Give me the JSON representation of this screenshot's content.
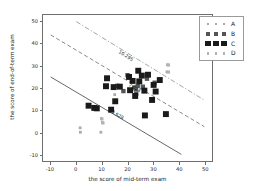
{
  "chart_data": {
    "type": "scatter",
    "title": "",
    "xlabel": "the score of mid-term exam",
    "ylabel": "the score of end-of-term exam",
    "xlim": [
      -13,
      53
    ],
    "ylim": [
      -13,
      53
    ],
    "xticks": [
      -10,
      0,
      10,
      20,
      30,
      40,
      50
    ],
    "yticks": [
      -10,
      0,
      10,
      20,
      30,
      40,
      50
    ],
    "xticklabels": [
      "-10",
      "0",
      "10",
      "20",
      "30",
      "40",
      "50"
    ],
    "yticklabels": [
      "-10",
      "0",
      "10",
      "20",
      "30",
      "40",
      "50"
    ],
    "grid": false,
    "legend_position": "upper right",
    "series": [
      {
        "name": "A",
        "marker": "square",
        "marker_size": 1.4,
        "color": "#aaaaaa",
        "points": [
          [
            1.5,
            2.0
          ],
          [
            1.6,
            0.0
          ],
          [
            9.8,
            6.2
          ],
          [
            10.2,
            4.4
          ],
          [
            9.6,
            0.0
          ],
          [
            35.6,
            30.5
          ],
          [
            35.4,
            27.3
          ],
          [
            15.0,
            17.0
          ]
        ]
      },
      {
        "name": "B",
        "marker": "square",
        "marker_size": 2.2,
        "color": "#555555",
        "points": [
          [
            20.0,
            25.8
          ],
          [
            22.6,
            20.2
          ],
          [
            23.2,
            19.4
          ],
          [
            24.0,
            21.0
          ],
          [
            23.4,
            17.4
          ],
          [
            26.0,
            20.6
          ],
          [
            18.4,
            18.6
          ],
          [
            16.0,
            21.0
          ],
          [
            27.6,
            24.2
          ],
          [
            30.6,
            22.4
          ]
        ]
      },
      {
        "name": "C",
        "marker": "square",
        "marker_size": 3.0,
        "color": "#1a1a1a",
        "points": [
          [
            12.0,
            24.4
          ],
          [
            11.6,
            20.8
          ],
          [
            14.6,
            20.4
          ],
          [
            17.0,
            20.6
          ],
          [
            15.2,
            14.0
          ],
          [
            13.6,
            10.2
          ],
          [
            4.8,
            12.0
          ],
          [
            7.0,
            11.0
          ],
          [
            8.0,
            10.8
          ],
          [
            22.0,
            23.2
          ],
          [
            21.0,
            19.0
          ],
          [
            23.0,
            16.4
          ],
          [
            24.2,
            27.8
          ],
          [
            25.6,
            25.6
          ],
          [
            26.6,
            18.8
          ],
          [
            28.0,
            26.0
          ],
          [
            29.6,
            14.6
          ],
          [
            26.8,
            7.6
          ],
          [
            30.2,
            21.4
          ],
          [
            32.6,
            23.6
          ],
          [
            31.0,
            18.4
          ],
          [
            35.0,
            8.2
          ],
          [
            24.6,
            23.0
          ],
          [
            20.6,
            25.0
          ]
        ]
      },
      {
        "name": "D",
        "marker": "square",
        "marker_size": 1.6,
        "color": "#b4b4b4",
        "points": [
          [
            36.0,
            30.4
          ],
          [
            36.0,
            27.2
          ],
          [
            10.0,
            6.0
          ],
          [
            10.4,
            4.2
          ]
        ]
      }
    ],
    "lines": [
      {
        "name": "lower-boundary",
        "style": "solid",
        "color": "#555555",
        "label": "3.628",
        "p1": [
          -10,
          25
        ],
        "p2": [
          41,
          -10
        ],
        "label_at": [
          13.5,
          11.0
        ]
      },
      {
        "name": "middle-boundary",
        "style": "dashed",
        "color": "#7a7a7a",
        "label": "7.028",
        "p1": [
          -10,
          44
        ],
        "p2": [
          50,
          2.5
        ],
        "label_at": [
          20.0,
          23.2
        ]
      },
      {
        "name": "upper-boundary",
        "style": "dashdot",
        "color": "#9a9a9a",
        "label": "10.295",
        "p1": [
          0,
          50
        ],
        "p2": [
          50,
          14.5
        ],
        "label_at": [
          16.5,
          38.0
        ]
      }
    ],
    "legend_entries": [
      {
        "label": "A",
        "marker_size": 1.4,
        "color": "#aaaaaa"
      },
      {
        "label": "B",
        "marker_size": 2.2,
        "color": "#555555"
      },
      {
        "label": "C",
        "marker_size": 3.0,
        "color": "#1a1a1a"
      },
      {
        "label": "D",
        "marker_size": 1.6,
        "color": "#b4b4b4"
      }
    ]
  }
}
